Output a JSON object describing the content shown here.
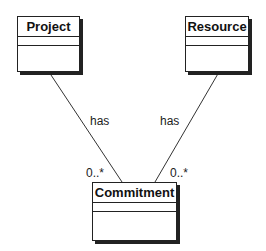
{
  "classes": {
    "project": {
      "name": "Project"
    },
    "resource": {
      "name": "Resource"
    },
    "commitment": {
      "name": "Commitment"
    }
  },
  "associations": {
    "project_commitment": {
      "label": "has",
      "multiplicity": "0..*"
    },
    "resource_commitment": {
      "label": "has",
      "multiplicity": "0..*"
    }
  }
}
